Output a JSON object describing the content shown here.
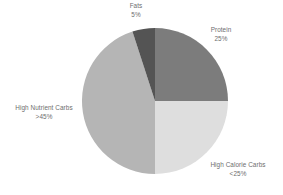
{
  "chart_data": {
    "type": "pie",
    "title": "",
    "subtitle": "",
    "xlabel": "",
    "ylabel": "",
    "legend_position": "none",
    "grid": false,
    "labels_outside": true,
    "start_angle_deg": 0,
    "direction": "clockwise",
    "categories": [
      "Protein",
      "High Calorie Carbs",
      "High Nutrient Carbs",
      "Fats"
    ],
    "values": [
      25,
      25,
      45,
      5
    ],
    "value_labels": [
      "25%",
      "<25%",
      ">45%",
      "5%"
    ],
    "colors": [
      "#7c7c7c",
      "#dedede",
      "#b5b5b5",
      "#545454"
    ],
    "slices": [
      {
        "name": "Protein",
        "value": 25,
        "value_label": "25%",
        "color": "#7c7c7c",
        "start_deg": 0,
        "end_deg": 90
      },
      {
        "name": "High Calorie Carbs",
        "value": 25,
        "value_label": "<25%",
        "color": "#dedede",
        "start_deg": 90,
        "end_deg": 180
      },
      {
        "name": "High Nutrient Carbs",
        "value": 45,
        "value_label": ">45%",
        "color": "#b5b5b5",
        "start_deg": 180,
        "end_deg": 342
      },
      {
        "name": "Fats",
        "value": 5,
        "value_label": "5%",
        "color": "#545454",
        "start_deg": 342,
        "end_deg": 360
      }
    ]
  },
  "labels": {
    "fats": {
      "name": "Fats",
      "value": "5%"
    },
    "protein": {
      "name": "Protein",
      "value": "25%"
    },
    "high_nutrient_carbs": {
      "name": "High Nutrient Carbs",
      "value": ">45%"
    },
    "high_calorie_carbs": {
      "name": "High Calorie Carbs",
      "value": "<25%"
    }
  },
  "geometry": {
    "center_x": 155,
    "center_y": 101,
    "radius": 73
  },
  "colors": {
    "background": "#ffffff",
    "text": "#6e6e6e",
    "protein": "#7c7c7c",
    "high_calorie_carbs": "#dedede",
    "high_nutrient_carbs": "#b5b5b5",
    "fats": "#545454"
  }
}
